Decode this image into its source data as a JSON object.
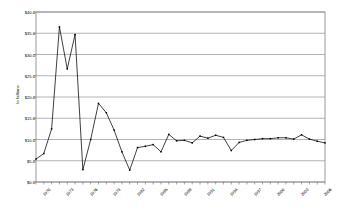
{
  "chart_data": {
    "type": "line",
    "title": "",
    "xlabel": "",
    "ylabel": "In billions",
    "ylim": [
      0,
      40
    ],
    "ytick_values": [
      0,
      5,
      10,
      15,
      20,
      25,
      30,
      35,
      40
    ],
    "ytick_labels": [
      "$0.0",
      "$5.0",
      "$10.0",
      "$15.0",
      "$20.0",
      "$25.0",
      "$30.0",
      "$35.0",
      "$40.0"
    ],
    "grid": true,
    "grid_axis": "y",
    "legend": "none",
    "marker": "square",
    "line_color": "#000000",
    "marker_color": "#000000",
    "plot_border_color": "#808080",
    "grid_color": "#808080",
    "background_color": "#ffffff",
    "xtick_label_interval": 3,
    "x": [
      "1970",
      "1971",
      "1972",
      "1973",
      "1974",
      "1975",
      "1976",
      "1977",
      "1978",
      "1979",
      "1980",
      "1981",
      "1982",
      "1983",
      "1984",
      "1985",
      "1986",
      "1987",
      "1988",
      "1989",
      "1990",
      "1991",
      "1992",
      "1993",
      "1994",
      "1995",
      "1996",
      "1997",
      "1998",
      "1999",
      "2000",
      "2001",
      "2002",
      "2003",
      "2004",
      "2005",
      "2006",
      "2007"
    ],
    "xtick_labels_shown": [
      "1970",
      "1973",
      "1976",
      "1979",
      "1982",
      "1985",
      "1988",
      "1991",
      "1994",
      "1997",
      "2000",
      "2003",
      "2006"
    ],
    "values": [
      5.4,
      6.7,
      12.5,
      36.5,
      26.6,
      34.7,
      2.9,
      10.0,
      18.5,
      16.3,
      12.2,
      7.1,
      2.8,
      8.1,
      8.4,
      8.8,
      7.1,
      11.2,
      9.7,
      9.8,
      9.2,
      10.8,
      10.3,
      11.0,
      10.5,
      7.4,
      9.3,
      9.8,
      10.0,
      10.2,
      10.2,
      10.4,
      10.4,
      10.1,
      11.1,
      10.1,
      9.6,
      9.2
    ],
    "series_name": "value"
  },
  "meta": {
    "y_axis_title": "In billions"
  }
}
